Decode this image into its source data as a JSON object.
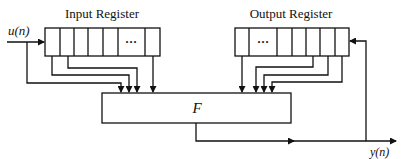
{
  "diagram": {
    "input_register_label": "Input Register",
    "output_register_label": "Output Register",
    "input_signal": "u(n)",
    "output_signal": "y(n)",
    "function_block": "F",
    "ellipsis": "···",
    "line_color": "#111111",
    "background": "#ffffff"
  }
}
